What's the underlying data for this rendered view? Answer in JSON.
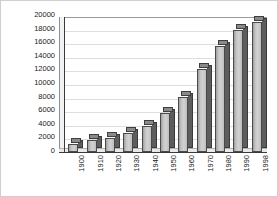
{
  "chart_data": {
    "type": "bar",
    "title": "",
    "subtitle": "",
    "xlabel": "",
    "ylabel": "In Thousands",
    "categories": [
      "1900",
      "1910",
      "1920",
      "1930",
      "1940",
      "1950",
      "1960",
      "1970",
      "1980",
      "1990",
      "1998"
    ],
    "values": [
      1200,
      1900,
      2200,
      2900,
      4000,
      6000,
      8400,
      12600,
      16200,
      18600,
      19900
    ],
    "series": [
      {
        "name": "In Thousands",
        "values": [
          1200,
          1900,
          2200,
          2900,
          4000,
          6000,
          8400,
          12600,
          16200,
          18600,
          19900
        ]
      }
    ],
    "ylim": [
      0,
      20000
    ],
    "ytick_step": 2000,
    "ytick_labels": [
      "20000",
      "18000",
      "16000",
      "14000",
      "12000",
      "10000",
      "8000",
      "6000",
      "4000",
      "2000",
      "0"
    ],
    "ytick_values": [
      20000,
      18000,
      16000,
      14000,
      12000,
      10000,
      8000,
      6000,
      4000,
      2000,
      0
    ],
    "grid": true,
    "grid_axis": "y",
    "legend": false,
    "legend_position": "none",
    "style": "3d-column",
    "bar_face_color": "#c9c9c9",
    "bar_side_color": "#5d5d5d",
    "bar_edge_color": "#3a3a3a",
    "plot_background": "#ffffff",
    "grid_color": "#dedede",
    "axis_color": "#3a3a3a",
    "text_color": "#1a1a1a"
  }
}
